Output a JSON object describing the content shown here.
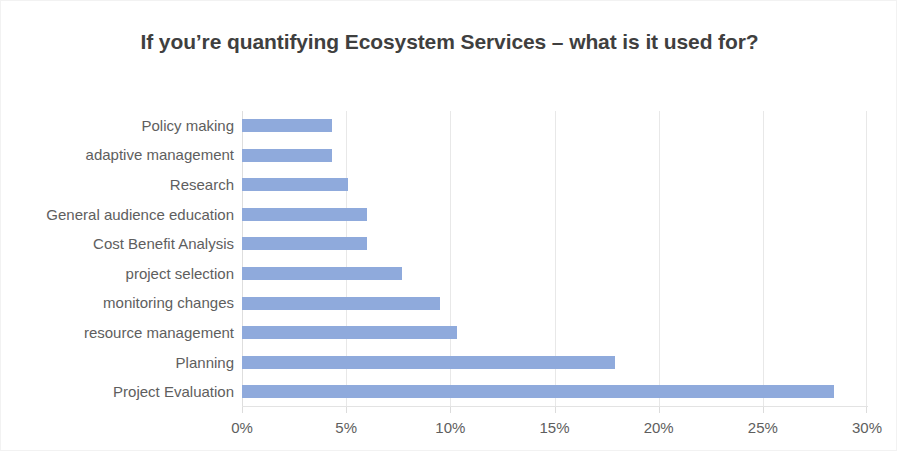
{
  "chart_data": {
    "type": "bar",
    "orientation": "horizontal",
    "title": "If you’re quantifying Ecosystem Services – what is it used for?",
    "xlabel": "",
    "ylabel": "",
    "categories": [
      "Policy making",
      "adaptive management",
      "Research",
      "General audience education",
      "Cost Benefit Analysis",
      "project selection",
      "monitoring changes",
      "resource management",
      "Planning",
      "Project Evaluation"
    ],
    "values": [
      4.3,
      4.3,
      5.1,
      6.0,
      6.0,
      7.7,
      9.5,
      10.3,
      17.9,
      28.4
    ],
    "value_suffix": "%",
    "xlim": [
      0,
      30
    ],
    "xticks": [
      0,
      5,
      10,
      15,
      20,
      25,
      30
    ],
    "xtick_labels": [
      "0%",
      "5%",
      "10%",
      "15%",
      "20%",
      "25%",
      "30%"
    ],
    "grid": true,
    "grid_axis": "x",
    "legend": false,
    "bar_color": "#8faadc",
    "gridline_color": "#e8e8e8",
    "title_color": "#3f3f3f",
    "label_color": "#5e5e5e",
    "background_color": "#ffffff"
  }
}
